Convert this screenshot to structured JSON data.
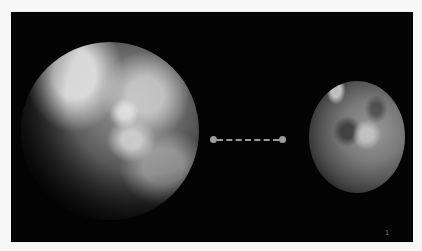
{
  "slide": {
    "page_number": "1",
    "background_color": "#030303",
    "images": [
      {
        "name": "earth",
        "description": "Earth seen from space (grayscale)"
      },
      {
        "name": "mars",
        "description": "Mars seen from space (grayscale)"
      }
    ],
    "connector": {
      "style": "dashed",
      "color": "#9d9d9d",
      "endpoints": "dots"
    }
  }
}
